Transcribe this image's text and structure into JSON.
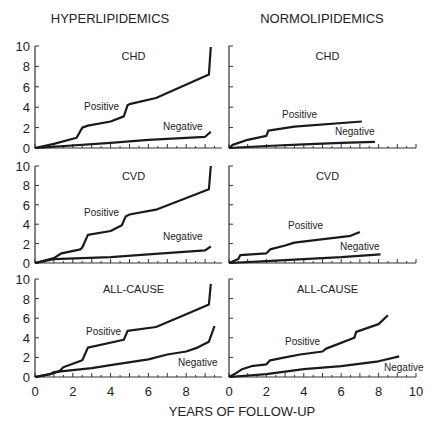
{
  "columns": [
    "HYPERLIPIDEMICS",
    "NORMOLIPIDEMICS"
  ],
  "xlabel": "YEARS OF FOLLOW-UP",
  "chart_data": [
    {
      "type": "line",
      "panel": "hyper-chd",
      "title": "CHD",
      "column": "HYPERLIPIDEMICS",
      "xlim": [
        0,
        10
      ],
      "ylim": [
        0,
        10
      ],
      "yticks": [
        0,
        2,
        4,
        6,
        8,
        10
      ],
      "xticks": [
        0,
        2,
        4,
        6,
        8,
        10
      ],
      "series": [
        {
          "name": "Positive",
          "x": [
            0,
            1,
            2.2,
            2.5,
            2.8,
            4,
            4.7,
            4.9,
            5,
            6.4,
            9.2,
            9.3
          ],
          "y": [
            0,
            0.4,
            1.0,
            2.0,
            2.2,
            2.6,
            3.1,
            4.2,
            4.3,
            4.9,
            7.2,
            9.9
          ]
        },
        {
          "name": "Negative",
          "x": [
            0,
            4,
            6,
            9,
            9.3
          ],
          "y": [
            0,
            0.5,
            0.8,
            1.1,
            1.6
          ]
        }
      ]
    },
    {
      "type": "line",
      "panel": "normo-chd",
      "title": "CHD",
      "column": "NORMOLIPIDEMICS",
      "xlim": [
        0,
        10
      ],
      "ylim": [
        0,
        10
      ],
      "series": [
        {
          "name": "Positive",
          "x": [
            0,
            0.2,
            1,
            2,
            2.1,
            3.5,
            7.1
          ],
          "y": [
            0,
            0.3,
            0.8,
            1.2,
            1.7,
            2.1,
            2.6
          ]
        },
        {
          "name": "Negative",
          "x": [
            0,
            2,
            4,
            6,
            7.8
          ],
          "y": [
            0,
            0.2,
            0.35,
            0.5,
            0.6
          ]
        }
      ]
    },
    {
      "type": "line",
      "panel": "hyper-cvd",
      "title": "CVD",
      "column": "HYPERLIPIDEMICS",
      "xlim": [
        0,
        10
      ],
      "ylim": [
        0,
        10
      ],
      "series": [
        {
          "name": "Positive",
          "x": [
            0,
            1,
            1.4,
            2.4,
            2.5,
            2.8,
            4,
            4.6,
            4.8,
            5,
            6.4,
            9.2,
            9.3
          ],
          "y": [
            0,
            0.5,
            1.0,
            1.4,
            1.6,
            2.9,
            3.3,
            3.9,
            4.8,
            5.0,
            5.5,
            7.6,
            10.0
          ]
        },
        {
          "name": "Negative",
          "x": [
            0,
            1,
            4,
            6,
            9,
            9.3
          ],
          "y": [
            0,
            0.4,
            0.6,
            0.9,
            1.3,
            1.7
          ]
        }
      ]
    },
    {
      "type": "line",
      "panel": "normo-cvd",
      "title": "CVD",
      "column": "NORMOLIPIDEMICS",
      "xlim": [
        0,
        10
      ],
      "ylim": [
        0,
        10
      ],
      "series": [
        {
          "name": "Positive",
          "x": [
            0,
            0.5,
            0.6,
            2,
            2.2,
            3,
            3.5,
            6.5,
            7
          ],
          "y": [
            0,
            0.4,
            0.8,
            1.0,
            1.4,
            1.8,
            2.1,
            2.8,
            3.2
          ]
        },
        {
          "name": "Negative",
          "x": [
            0,
            2,
            4,
            6,
            8.1
          ],
          "y": [
            0,
            0.2,
            0.4,
            0.6,
            0.9
          ]
        }
      ]
    },
    {
      "type": "line",
      "panel": "hyper-all",
      "title": "ALL-CAUSE",
      "column": "HYPERLIPIDEMICS",
      "xlim": [
        0,
        10
      ],
      "ylim": [
        0,
        10
      ],
      "series": [
        {
          "name": "Positive",
          "x": [
            0,
            0.8,
            1.3,
            1.5,
            2.5,
            2.8,
            4.7,
            4.9,
            6.4,
            8,
            9.2,
            9.3
          ],
          "y": [
            0,
            0.3,
            0.6,
            1.0,
            1.7,
            3.0,
            3.8,
            4.7,
            5.1,
            6.4,
            7.4,
            9.5
          ]
        },
        {
          "name": "Negative",
          "x": [
            0,
            0.8,
            1,
            3,
            4,
            6,
            7,
            8,
            8.6,
            9.2,
            9.5
          ],
          "y": [
            0,
            0.3,
            0.5,
            0.9,
            1.2,
            1.8,
            2.3,
            2.6,
            3.0,
            3.6,
            5.2
          ]
        }
      ]
    },
    {
      "type": "line",
      "panel": "normo-all",
      "title": "ALL-CAUSE",
      "column": "NORMOLIPIDEMICS",
      "xlim": [
        0,
        10
      ],
      "ylim": [
        0,
        10
      ],
      "series": [
        {
          "name": "Positive",
          "x": [
            0,
            0.3,
            0.7,
            1.2,
            2,
            2.2,
            3,
            3.8,
            5,
            5.2,
            6.7,
            6.8,
            8,
            8.5
          ],
          "y": [
            0,
            0.3,
            0.8,
            1.1,
            1.3,
            1.7,
            2.0,
            2.3,
            2.6,
            2.9,
            4.0,
            4.6,
            5.4,
            6.3
          ]
        },
        {
          "name": "Negative",
          "x": [
            0,
            2,
            4,
            6,
            8,
            9.1
          ],
          "y": [
            0,
            0.3,
            0.8,
            1.1,
            1.6,
            2.1
          ]
        }
      ]
    }
  ]
}
